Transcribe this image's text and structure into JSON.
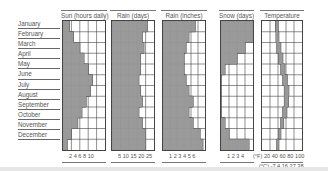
{
  "chart_data": {
    "type": "area",
    "months": [
      "January",
      "February",
      "March",
      "April",
      "May",
      "June",
      "July",
      "August",
      "September",
      "October",
      "November",
      "December"
    ],
    "panels": [
      {
        "name": "Sun (hours daily)",
        "xlabel": "Sun (hours daily)",
        "ticks": [
          "2",
          "4",
          "6",
          "8",
          "10"
        ],
        "xlim": [
          0,
          10
        ],
        "values": [
          1.5,
          2.5,
          4.0,
          5.0,
          6.0,
          7.0,
          6.5,
          5.5,
          4.5,
          3.5,
          2.0,
          1.0
        ]
      },
      {
        "name": "Rain (days)",
        "xlabel": "Rain (days)",
        "ticks": [
          "5",
          "10",
          "15",
          "20",
          "25"
        ],
        "xlim": [
          0,
          25
        ],
        "values": [
          21,
          18,
          19,
          17,
          17,
          16,
          17,
          18,
          16,
          18,
          20,
          20
        ]
      },
      {
        "name": "Rain (inches)",
        "xlabel": "Rain (inches)",
        "ticks": [
          "1",
          "2",
          "3",
          "4",
          "5",
          "6"
        ],
        "xlim": [
          0,
          6
        ],
        "values": [
          4.6,
          3.7,
          3.3,
          3.0,
          3.0,
          3.3,
          3.7,
          4.3,
          3.7,
          4.3,
          5.3,
          5.7
        ]
      },
      {
        "name": "Snow (days)",
        "xlabel": "Snow (days)",
        "ticks": [
          "1",
          "2",
          "3",
          "4"
        ],
        "xlim": [
          0,
          4
        ],
        "values": [
          4,
          4,
          3,
          2,
          0.5,
          0,
          0,
          0,
          0,
          0.5,
          1,
          3.5
        ]
      },
      {
        "name": "Temperature",
        "xlabel": "Temperature",
        "ticks_f": [
          "20",
          "40",
          "60",
          "80",
          "100"
        ],
        "ticks_c": [
          "-7",
          "4",
          "16",
          "27",
          "38"
        ],
        "unit_f": "(°F)",
        "unit_c": "(°C)",
        "xlim": [
          0,
          100
        ],
        "low": [
          34,
          35,
          37,
          42,
          47,
          52,
          56,
          56,
          52,
          47,
          42,
          37
        ],
        "high": [
          40,
          42,
          47,
          52,
          57,
          63,
          67,
          66,
          62,
          54,
          47,
          42
        ]
      }
    ]
  },
  "labels": {
    "months": [
      "January",
      "February",
      "March",
      "April",
      "May",
      "June",
      "July",
      "August",
      "September",
      "October",
      "November",
      "December"
    ],
    "sun_title": "Sun (hours daily)",
    "rain_days_title": "Rain (days)",
    "rain_in_title": "Rain (inches)",
    "snow_title": "Snow (days)",
    "temp_title": "Temperature",
    "sun_ticks": "2  4  6  8  10",
    "rain_days_ticks": "5  10 15 20 25",
    "rain_in_ticks": "1   2   3   4   5   6",
    "snow_ticks": "1   2   3   4",
    "temp_f_ticks": "(°F) 20 40 60 80 100",
    "temp_c_ticks": "(°C) -7  4  16 27 38"
  },
  "colors": {
    "fill": "#9a9a9a",
    "grid": "#444444",
    "background": "#ffffff"
  }
}
